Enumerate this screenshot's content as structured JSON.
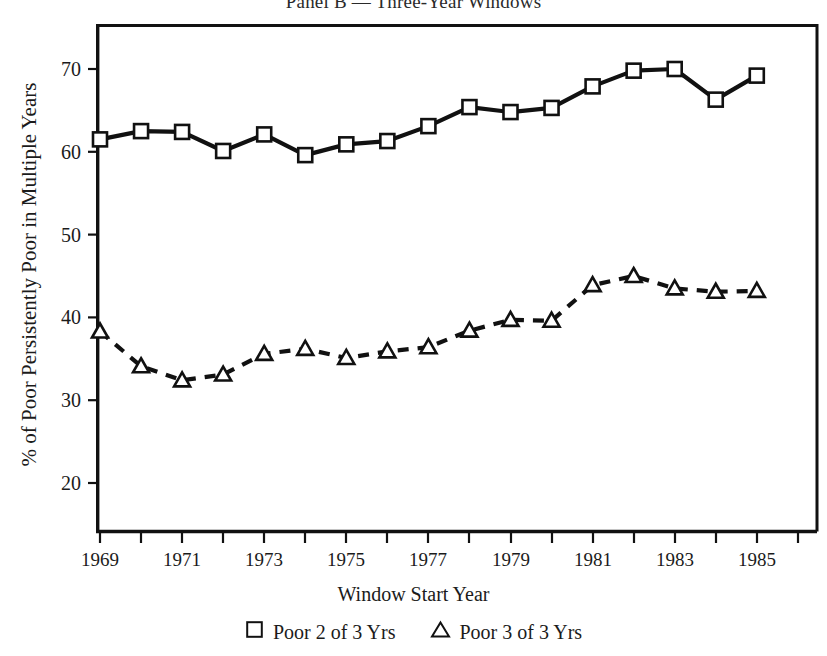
{
  "panel": {
    "title": "Panel B — Three-Year Windows"
  },
  "axes": {
    "y_title": "% of Poor Persistently Poor in Multiple Years",
    "x_title": "Window Start Year"
  },
  "legend": {
    "items": [
      {
        "glyph": "square-outline-icon",
        "label": "Poor 2 of 3 Yrs"
      },
      {
        "glyph": "triangle-outline-icon",
        "label": "Poor 3 of 3 Yrs"
      }
    ]
  },
  "chart_data": {
    "type": "line",
    "title": "Panel B — Three-Year Windows",
    "xlabel": "Window Start Year",
    "ylabel": "% of Poor Persistently Poor in Multiple Years",
    "xlim": [
      1968,
      1986
    ],
    "ylim": [
      15,
      73
    ],
    "grid": false,
    "legend_position": "bottom",
    "x": [
      1969,
      1970,
      1971,
      1972,
      1973,
      1974,
      1975,
      1976,
      1977,
      1978,
      1979,
      1980,
      1981,
      1982,
      1983,
      1984,
      1985
    ],
    "xticks": [
      1969,
      1971,
      1973,
      1975,
      1977,
      1979,
      1981,
      1983,
      1985
    ],
    "xtick_labels": [
      "1969",
      "1971",
      "1973",
      "1975",
      "1977",
      "1979",
      "1981",
      "1983",
      "1985"
    ],
    "yticks": [
      20,
      30,
      40,
      50,
      60,
      70
    ],
    "ytick_labels": [
      "20",
      "30",
      "40",
      "50",
      "60",
      "70"
    ],
    "series": [
      {
        "name": "Poor 2 of 3 Yrs",
        "marker": "square",
        "line_style": "solid",
        "color": "#111111",
        "values": [
          61.5,
          62.5,
          62.4,
          60.1,
          62.1,
          59.6,
          60.9,
          61.3,
          63.1,
          65.4,
          64.8,
          65.3,
          67.9,
          69.8,
          70.0,
          66.3,
          69.2
        ]
      },
      {
        "name": "Poor 3 of 3 Yrs",
        "marker": "triangle",
        "line_style": "dashed",
        "color": "#111111",
        "values": [
          38.3,
          34.1,
          32.4,
          33.1,
          35.6,
          36.2,
          35.1,
          35.9,
          36.4,
          38.4,
          39.7,
          39.6,
          43.9,
          45.0,
          43.5,
          43.1,
          43.2
        ]
      }
    ]
  }
}
